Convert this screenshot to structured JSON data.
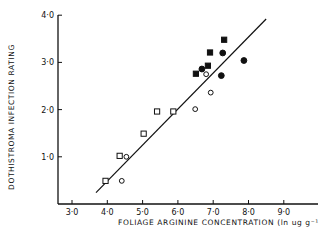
{
  "chart_data": {
    "type": "scatter",
    "title": "",
    "xlabel": "FOLIAGE   ARGININE   CONCENTRATION (ln ug g⁻¹)",
    "ylabel": "DOTHISTROMA   INFECTION   RATING",
    "xlim": [
      2.6,
      9.9
    ],
    "ylim": [
      0,
      4.0
    ],
    "x_ticks": [
      3.0,
      4.0,
      5.0,
      6.0,
      7.0,
      8.0,
      9.0
    ],
    "x_tick_labels": [
      "3·0",
      "4·0",
      "5·0",
      "6·0",
      "7·0",
      "8·0",
      "9·0"
    ],
    "y_ticks": [
      1.0,
      2.0,
      3.0,
      4.0
    ],
    "y_tick_labels": [
      "1·0",
      "2·0",
      "3·0",
      "4·0"
    ],
    "grid": false,
    "legend": null,
    "series": [
      {
        "name": "open-square",
        "marker": "square",
        "filled": false,
        "points": [
          [
            3.95,
            0.49
          ],
          [
            4.35,
            1.02
          ],
          [
            5.03,
            1.49
          ],
          [
            5.41,
            1.96
          ],
          [
            5.87,
            1.96
          ]
        ]
      },
      {
        "name": "open-circle",
        "marker": "circle",
        "filled": false,
        "points": [
          [
            4.41,
            0.49
          ],
          [
            4.54,
            1.0
          ],
          [
            6.49,
            2.01
          ],
          [
            6.93,
            2.36
          ],
          [
            6.8,
            2.75
          ]
        ]
      },
      {
        "name": "filled-square",
        "marker": "square",
        "filled": true,
        "points": [
          [
            6.51,
            2.76
          ],
          [
            6.85,
            2.93
          ],
          [
            6.91,
            3.21
          ],
          [
            7.31,
            3.48
          ]
        ]
      },
      {
        "name": "filled-circle",
        "marker": "circle",
        "filled": true,
        "points": [
          [
            6.68,
            2.86
          ],
          [
            7.27,
            3.2
          ],
          [
            7.23,
            2.72
          ],
          [
            7.87,
            3.04
          ]
        ]
      }
    ],
    "regression_line": {
      "x": [
        3.68,
        8.5
      ],
      "y": [
        0.24,
        3.92
      ]
    }
  },
  "layout": {
    "origin_px": [
      58,
      204
    ],
    "x_px_per_unit": 35.3,
    "x_ref_value": 3.0,
    "x_ref_px": 72,
    "y_px_per_unit": 47.2,
    "x_axis_end_px": 318,
    "y_axis_top_px": 15,
    "ink_color": "#111111"
  }
}
